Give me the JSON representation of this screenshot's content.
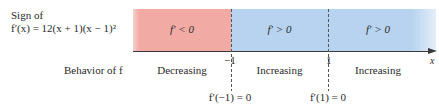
{
  "sign_label": {
    "line1": "Sign of",
    "line2": "f′(x) = 12(x + 1)(x − 1)²"
  },
  "behavior_label": "Behavior of f",
  "axis": {
    "variable": "x",
    "ticks": [
      "−1",
      "1"
    ]
  },
  "regions": [
    {
      "sign": "f′ < 0",
      "behavior": "Decreasing",
      "color": "#f2aaa5"
    },
    {
      "sign": "f′ > 0",
      "behavior": "Increasing",
      "color": "#b7d3ef"
    },
    {
      "sign": "f′ > 0",
      "behavior": "Increasing",
      "color": "#b7d3ef"
    }
  ],
  "critical_points": [
    "f′(−1) = 0",
    "f′(1) = 0"
  ]
}
